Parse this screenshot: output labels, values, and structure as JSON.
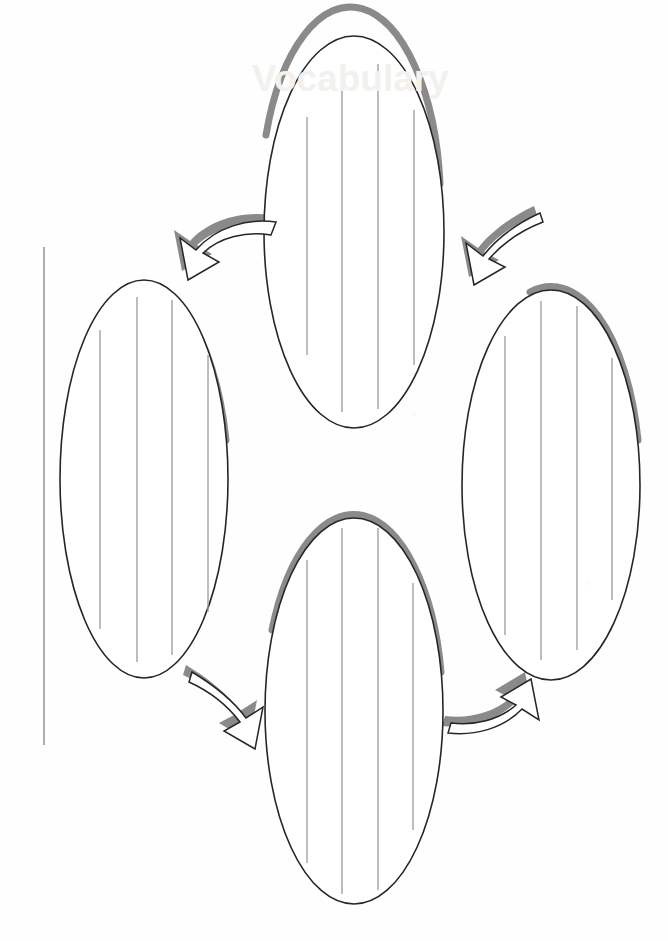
{
  "document": {
    "kind": "printable-graphic-organizer",
    "orientation_note": "scanned page rotated 90 degrees",
    "watermark_text": "Vocabulary",
    "page_background": "#fefefe",
    "outline_color": "#262626",
    "shadow_color": "#8a8a8a",
    "writing_line_color": "#9a9a9a",
    "title_line_color": "#9a9a9a"
  },
  "title_line": {
    "label": "",
    "x": 44,
    "y1": 247,
    "y2": 745
  },
  "ovals": [
    {
      "id": "oval-top",
      "position": "top",
      "label": "",
      "cx": 354,
      "cy": 232,
      "rx": 90,
      "ry": 196,
      "line_count": 4
    },
    {
      "id": "oval-left",
      "position": "left",
      "label": "",
      "cx": 144,
      "cy": 479,
      "rx": 84,
      "ry": 199,
      "line_count": 4
    },
    {
      "id": "oval-right",
      "position": "right",
      "label": "",
      "cx": 551,
      "cy": 485,
      "rx": 89,
      "ry": 195,
      "line_count": 4
    },
    {
      "id": "oval-bottom",
      "position": "bottom",
      "label": "",
      "cx": 354,
      "cy": 711,
      "rx": 89,
      "ry": 193,
      "line_count": 4
    }
  ],
  "arrows": [
    {
      "id": "arrow-top-left",
      "from": "oval-top",
      "to": "oval-left",
      "direction": "points-down-left"
    },
    {
      "id": "arrow-top-right",
      "from": "oval-right",
      "to": "oval-top",
      "direction": "points-up-left"
    },
    {
      "id": "arrow-bottom-left",
      "from": "oval-left",
      "to": "oval-bottom",
      "direction": "points-down-right"
    },
    {
      "id": "arrow-bottom-right",
      "from": "oval-bottom",
      "to": "oval-right",
      "direction": "points-up-right"
    }
  ]
}
